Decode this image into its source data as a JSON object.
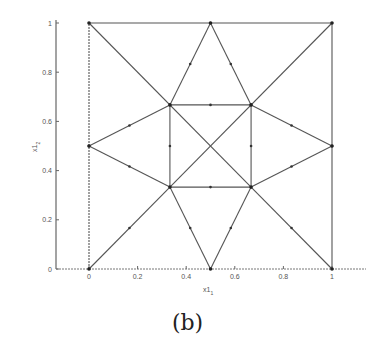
{
  "chart_data": {
    "type": "diagram",
    "title": "",
    "xlabel": "x1_1",
    "ylabel": "x1_2",
    "xlim": [
      0,
      1
    ],
    "ylim": [
      0,
      1
    ],
    "x_ticks": [
      "0",
      "0.2",
      "0.4",
      "0.6",
      "0.8",
      "1"
    ],
    "y_ticks": [
      "0",
      "0.2",
      "0.4",
      "0.6",
      "0.8",
      "1"
    ],
    "grid": false,
    "nodes": [
      [
        0,
        0
      ],
      [
        0.5,
        0
      ],
      [
        1,
        0
      ],
      [
        0,
        0.5
      ],
      [
        1,
        0.5
      ],
      [
        0,
        1
      ],
      [
        0.5,
        1
      ],
      [
        1,
        1
      ],
      [
        0.333,
        0.333
      ],
      [
        0.667,
        0.333
      ],
      [
        0.333,
        0.667
      ],
      [
        0.667,
        0.667
      ]
    ],
    "edges": [
      [
        [
          0,
          0
        ],
        [
          0,
          1
        ]
      ],
      [
        [
          0,
          1
        ],
        [
          1,
          1
        ]
      ],
      [
        [
          1,
          1
        ],
        [
          1,
          0
        ]
      ],
      [
        [
          0,
          1
        ],
        [
          0.667,
          0.333
        ]
      ],
      [
        [
          1,
          1
        ],
        [
          0.333,
          0.333
        ]
      ],
      [
        [
          0,
          0
        ],
        [
          0.333,
          0.333
        ]
      ],
      [
        [
          1,
          0
        ],
        [
          0.667,
          0.333
        ]
      ],
      [
        [
          0.5,
          1
        ],
        [
          0.333,
          0.667
        ]
      ],
      [
        [
          0.5,
          1
        ],
        [
          0.667,
          0.667
        ]
      ],
      [
        [
          0.5,
          0
        ],
        [
          0.333,
          0.333
        ]
      ],
      [
        [
          0.5,
          0
        ],
        [
          0.667,
          0.333
        ]
      ],
      [
        [
          0,
          0.5
        ],
        [
          0.333,
          0.667
        ]
      ],
      [
        [
          0,
          0.5
        ],
        [
          0.333,
          0.333
        ]
      ],
      [
        [
          1,
          0.5
        ],
        [
          0.667,
          0.667
        ]
      ],
      [
        [
          1,
          0.5
        ],
        [
          0.667,
          0.333
        ]
      ],
      [
        [
          0.333,
          0.667
        ],
        [
          0.667,
          0.667
        ]
      ],
      [
        [
          0.333,
          0.333
        ],
        [
          0.667,
          0.333
        ]
      ],
      [
        [
          0.333,
          0.333
        ],
        [
          0.333,
          0.667
        ]
      ],
      [
        [
          0.667,
          0.333
        ],
        [
          0.667,
          0.667
        ]
      ]
    ],
    "line_color": "#555555"
  },
  "caption": "(b)",
  "axes": {
    "xlabel_main": "x1",
    "xlabel_sub": "1",
    "ylabel_main": "x1",
    "ylabel_sub": "2"
  }
}
